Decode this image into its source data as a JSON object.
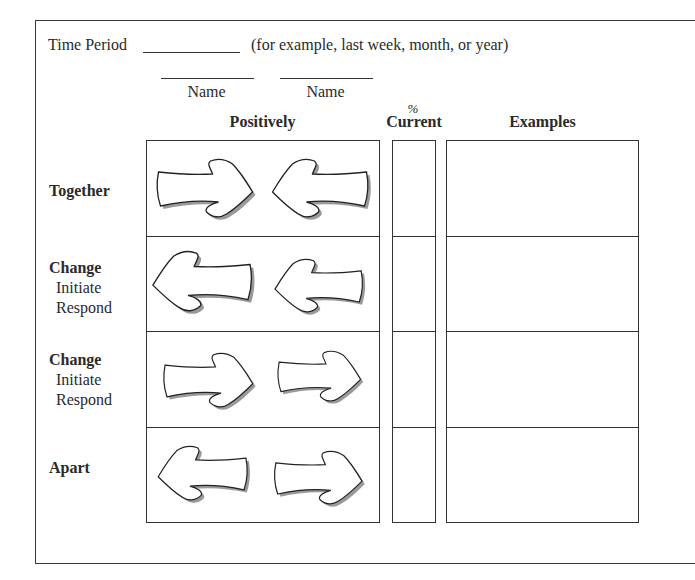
{
  "header": {
    "time_period_label": "Time Period",
    "time_period_hint": "(for example, last week, month, or year)",
    "name_labels": [
      "Name",
      "Name"
    ]
  },
  "columns": {
    "positively": "Positively",
    "percent_symbol": "%",
    "current": "Current",
    "examples": "Examples"
  },
  "rows": [
    {
      "title": "Together",
      "sub": [],
      "arrows": [
        "right",
        "left"
      ]
    },
    {
      "title": "Change",
      "sub": [
        "Initiate",
        "Respond"
      ],
      "arrows": [
        "left",
        "left"
      ]
    },
    {
      "title": "Change",
      "sub": [
        "Initiate",
        "Respond"
      ],
      "arrows": [
        "right",
        "right"
      ]
    },
    {
      "title": "Apart",
      "sub": [],
      "arrows": [
        "left",
        "right"
      ]
    }
  ],
  "colors": {
    "line": "#333333",
    "shadow": "#9a9a9a",
    "text": "#2a2a2a"
  }
}
